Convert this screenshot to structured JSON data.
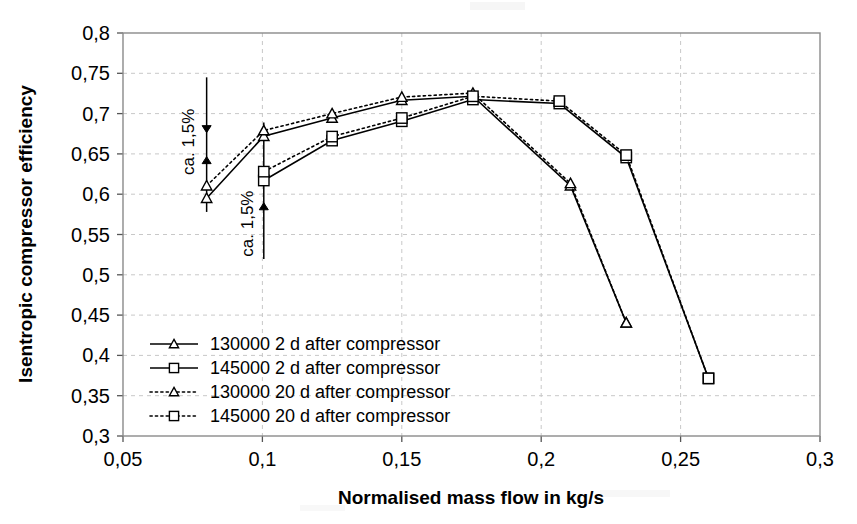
{
  "chart_data": {
    "type": "line",
    "title": "",
    "xlabel": "Normalised mass flow in kg/s",
    "ylabel": "Isentropic compressor efficiency",
    "xlim": [
      0.05,
      0.3
    ],
    "ylim": [
      0.3,
      0.8
    ],
    "xticks": [
      0.05,
      0.1,
      0.15,
      0.2,
      0.25,
      0.3
    ],
    "xtick_labels": [
      "0,05",
      "0,1",
      "0,15",
      "0,2",
      "0,25",
      "0,3"
    ],
    "yticks": [
      0.3,
      0.35,
      0.4,
      0.45,
      0.5,
      0.55,
      0.6,
      0.65,
      0.7,
      0.75,
      0.8
    ],
    "ytick_labels": [
      "0,3",
      "0,35",
      "0,4",
      "0,45",
      "0,5",
      "0,55",
      "0,6",
      "0,65",
      "0,7",
      "0,75",
      "0,8"
    ],
    "grid": true,
    "grid_style": "dotted",
    "legend_position": "inside-lower-left",
    "series": [
      {
        "name": "130000 2 d after compressor",
        "style": "solid",
        "marker": "triangle",
        "x": [
          0.08,
          0.1005,
          0.125,
          0.15,
          0.1755,
          0.2105,
          0.2305
        ],
        "y": [
          0.595,
          0.672,
          0.6945,
          0.7165,
          0.7215,
          0.6105,
          0.4405
        ]
      },
      {
        "name": "145000 2 d after compressor",
        "style": "solid",
        "marker": "square",
        "x": [
          0.1005,
          0.125,
          0.15,
          0.1755,
          0.2065,
          0.2305,
          0.26
        ],
        "y": [
          0.617,
          0.6665,
          0.6905,
          0.7175,
          0.7125,
          0.6455,
          0.3715
        ]
      },
      {
        "name": "130000 20 d after compressor",
        "style": "dotted",
        "marker": "triangle",
        "x": [
          0.08,
          0.1005,
          0.125,
          0.15,
          0.1755,
          0.2105,
          0.2305
        ],
        "y": [
          0.6105,
          0.679,
          0.7,
          0.7205,
          0.7255,
          0.6135,
          0.4405
        ]
      },
      {
        "name": "145000 20 d after compressor",
        "style": "dotted",
        "marker": "square",
        "x": [
          0.1005,
          0.125,
          0.15,
          0.1755,
          0.2065,
          0.2305,
          0.26
        ],
        "y": [
          0.628,
          0.6715,
          0.6945,
          0.7215,
          0.7155,
          0.6485,
          0.3715
        ]
      }
    ],
    "error_bars": [
      {
        "label": "ca. 1,5%",
        "x": 0.08,
        "y_low": 0.578,
        "y_high": 0.745,
        "label_orientation": "vertical"
      },
      {
        "label": "ca. 1,5%",
        "x": 0.1005,
        "y_low": 0.5195,
        "y_high": 0.689,
        "label_orientation": "vertical"
      }
    ],
    "annotations": [
      {
        "text": "ca. 1,5%",
        "x": 0.0755,
        "y": 0.665
      },
      {
        "text": "ca. 1,5%",
        "x": 0.0965,
        "y": 0.5635
      }
    ]
  },
  "legend": {
    "items": [
      {
        "label": "130000 2 d after compressor",
        "style": "solid",
        "marker": "triangle"
      },
      {
        "label": "145000 2 d after compressor",
        "style": "solid",
        "marker": "square"
      },
      {
        "label": "130000 20 d after compressor",
        "style": "dotted",
        "marker": "triangle"
      },
      {
        "label": "145000 20 d after compressor",
        "style": "dotted",
        "marker": "square"
      }
    ]
  },
  "colors": {
    "ink": "#000000",
    "grid": "#c8c8c8",
    "border": "#8a8a8a",
    "background": "#ffffff"
  }
}
